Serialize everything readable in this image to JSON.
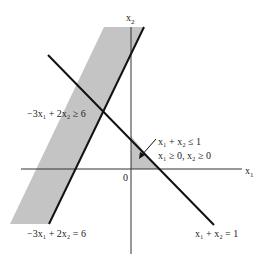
{
  "axes": {
    "x_label": "x",
    "x_sub": "1",
    "y_label": "x",
    "y_sub": "2",
    "origin_label": "0"
  },
  "constraints": {
    "band_inequality": "−3x₁ + 2x₂ ≥ 6",
    "band_boundary": "−3x₁ + 2x₂ = 6",
    "line_boundary": "x₁ + x₂ = 1",
    "triangle_line1": "x₁ + x₂ ≤ 1",
    "triangle_line2": "x₁ ≥ 0, x₂ ≥ 0"
  },
  "colors": {
    "shade": "#c4c4c4",
    "line": "#111111",
    "axis": "#333333"
  }
}
